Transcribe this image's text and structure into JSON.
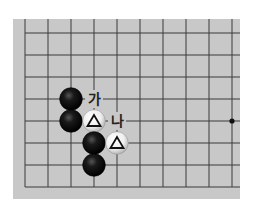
{
  "diagram": {
    "type": "go-board-fragment",
    "board_color": "#c8c8c8",
    "line_color": "#3a3a3a",
    "board_rect": {
      "x": 13,
      "y": 19,
      "w": 227,
      "h": 180
    },
    "grid": {
      "x_lines": [
        25,
        48,
        71,
        94,
        117,
        140,
        163,
        186,
        209,
        232
      ],
      "y_lines": [
        33,
        55,
        77,
        99,
        121,
        143,
        165,
        187
      ],
      "left_edge_line": true,
      "bottom_edge_line": true
    },
    "star_points": [
      {
        "col": 9,
        "row": 4
      }
    ],
    "stones": [
      {
        "color": "black",
        "col": 2,
        "row": 3
      },
      {
        "color": "black",
        "col": 2,
        "row": 4
      },
      {
        "color": "white",
        "col": 3,
        "row": 4,
        "mark": "triangle"
      },
      {
        "color": "black",
        "col": 3,
        "row": 5
      },
      {
        "color": "white",
        "col": 4,
        "row": 5,
        "mark": "triangle"
      },
      {
        "color": "black",
        "col": 3,
        "row": 6
      }
    ],
    "labels": [
      {
        "text": "가",
        "col": 3,
        "row": 3
      },
      {
        "text": "나",
        "col": 4,
        "row": 4
      }
    ]
  }
}
